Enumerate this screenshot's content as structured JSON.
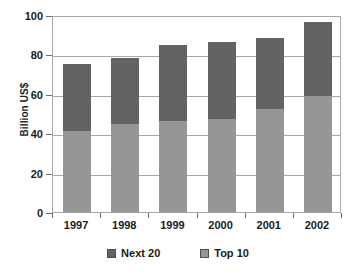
{
  "chart_data": {
    "type": "bar",
    "subtype": "stacked-vertical",
    "title": "",
    "subtitle": "",
    "xlabel": "",
    "ylabel": "Billion US$",
    "categories": [
      "1997",
      "1998",
      "1999",
      "2000",
      "2001",
      "2002"
    ],
    "series": [
      {
        "name": "Top 10",
        "color": "#969696",
        "values": [
          41,
          44.5,
          46,
          47,
          52.5,
          59
        ]
      },
      {
        "name": "Next 20",
        "color": "#636363",
        "values": [
          34,
          33.5,
          39,
          39.5,
          36,
          37.5
        ]
      }
    ],
    "stack_order_bottom_to_top": [
      "Top 10",
      "Next 20"
    ],
    "totals": [
      75,
      78,
      85,
      86.5,
      88.5,
      96.5
    ],
    "ylim": [
      0,
      100
    ],
    "yticks": [
      0,
      20,
      40,
      60,
      80,
      100
    ],
    "ytick_labels": [
      "0",
      "20",
      "40",
      "60",
      "80",
      "100"
    ],
    "grid": true,
    "grid_axis": "y",
    "legend_position": "bottom",
    "legend_entries": [
      {
        "label": "Next 20",
        "color": "#636363"
      },
      {
        "label": "Top 10",
        "color": "#969696"
      }
    ],
    "annotations": []
  },
  "colors": {
    "next20": "#636363",
    "top10": "#969696",
    "axis": "#a8a8a8",
    "text": "#1a1a1a",
    "background": "#ffffff"
  }
}
